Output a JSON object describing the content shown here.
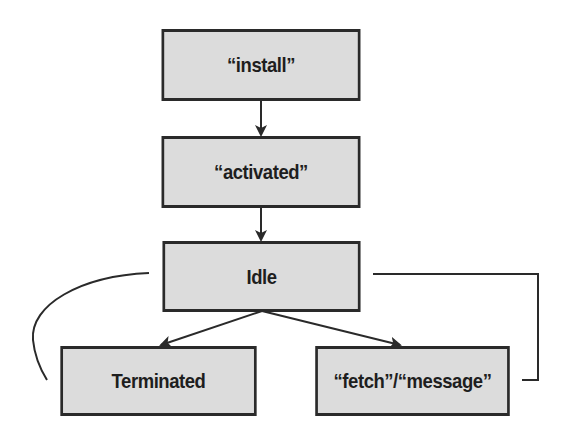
{
  "diagram": {
    "type": "state-diagram",
    "nodes": {
      "install": {
        "label": "“install”"
      },
      "activated": {
        "label": "“activated”"
      },
      "idle": {
        "label": "Idle"
      },
      "terminated": {
        "label": "Terminated"
      },
      "fetch_message": {
        "label": "“fetch”/“message”"
      }
    },
    "edges": [
      {
        "from": "install",
        "to": "activated",
        "style": "arrow"
      },
      {
        "from": "activated",
        "to": "idle",
        "style": "arrow"
      },
      {
        "from": "idle",
        "to": "terminated",
        "style": "arrow"
      },
      {
        "from": "idle",
        "to": "fetch_message",
        "style": "arrow"
      },
      {
        "from": "terminated",
        "to": "idle",
        "style": "curved-line"
      },
      {
        "from": "fetch_message",
        "to": "idle",
        "style": "elbow-line"
      }
    ],
    "colors": {
      "node_fill": "#dcdcdc",
      "node_border": "#2a2a2a",
      "edge": "#2a2a2a",
      "text": "#1e1e1e"
    }
  }
}
